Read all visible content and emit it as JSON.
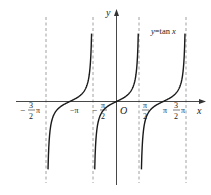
{
  "chart_data": {
    "type": "line",
    "title": "",
    "function": "y = tan x",
    "legend_label": "y=tan x",
    "xlabel": "x",
    "ylabel": "y",
    "origin_label": "O",
    "x_tick_labels": [
      "-3/2 π",
      "-π",
      "-π/2",
      "O",
      "π/2",
      "π",
      "3/2 π"
    ],
    "asymptotes": [
      "-3π/2",
      "-π/2",
      "π/2",
      "3π/2"
    ],
    "zero_crossings": [
      "-π",
      "0",
      "π"
    ],
    "branches": [
      {
        "from": "-3π/2",
        "to": "-π/2",
        "zero_at": "-π"
      },
      {
        "from": "-π/2",
        "to": "π/2",
        "zero_at": "0"
      },
      {
        "from": "π/2",
        "to": "3π/2",
        "zero_at": "π"
      }
    ],
    "grid": false,
    "asymptote_style": "dashed"
  },
  "labels": {
    "y_axis": "y",
    "x_axis": "x",
    "origin": "O",
    "legend": "y=tan x",
    "tick_neg_three_half_pi_num": "3",
    "tick_neg_three_half_pi_den": "2",
    "tick_neg_pi": "−π",
    "tick_neg_half_pi_num": "π",
    "tick_neg_half_pi_den": "2",
    "tick_half_pi_num": "π",
    "tick_half_pi_den": "2",
    "tick_pi": "π",
    "tick_three_half_pi_num": "3",
    "tick_three_half_pi_den": "2",
    "pi": "π",
    "minus": "−"
  },
  "colors": {
    "curve": "#1a1a1a",
    "axis": "#333333",
    "asymptote": "#888888"
  }
}
